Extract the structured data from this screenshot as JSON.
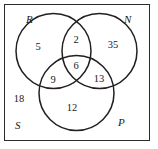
{
  "figure": {
    "kind": "venn-diagram-three-set",
    "universal_set_label": "S",
    "stroke_color": "#231f20",
    "background_color": "#ffffff",
    "border_color": "#2b2b2b"
  },
  "sets": {
    "r": {
      "label": "R"
    },
    "n": {
      "label": "N"
    },
    "p": {
      "label": "P"
    },
    "s": {
      "label": "S"
    }
  },
  "regions": {
    "r_only": "5",
    "r_and_n_only": "2",
    "n_only": "35",
    "r_and_n_and_p": "6",
    "r_and_p_only": "9",
    "n_and_p_only": "13",
    "p_only": "12",
    "outside_all": "18"
  }
}
